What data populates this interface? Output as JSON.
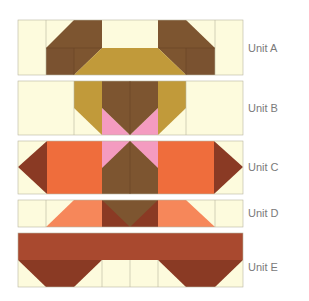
{
  "colors": {
    "cream": "#fdfbdd",
    "dark_brown": "#7d5530",
    "gold": "#c19a3a",
    "pink": "#f49bc0",
    "orange": "#ef6d3c",
    "salmon": "#f6875a",
    "rust": "#8a3a24",
    "brick": "#a9492f",
    "seam": "#b9b5a0"
  },
  "units": [
    {
      "id": "A",
      "label": "Unit A"
    },
    {
      "id": "B",
      "label": "Unit B"
    },
    {
      "id": "C",
      "label": "Unit C"
    },
    {
      "id": "D",
      "label": "Unit D"
    },
    {
      "id": "E",
      "label": "Unit E"
    }
  ]
}
